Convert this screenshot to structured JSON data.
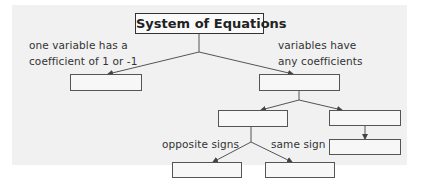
{
  "diagram": {
    "title": "System of Equations",
    "branches": {
      "left_label_line1": "one variable has a",
      "left_label_line2": "coefficient of 1 or -1",
      "right_label_line1": "variables have",
      "right_label_line2": "any coefficients",
      "sub_left_label": "opposite signs",
      "sub_right_label": "same sign"
    },
    "boxes": [
      {
        "id": "left-answer",
        "text": ""
      },
      {
        "id": "right-answer",
        "text": ""
      },
      {
        "id": "mid-left-answer",
        "text": ""
      },
      {
        "id": "mid-right-answer",
        "text": ""
      },
      {
        "id": "bottom-right-answer",
        "text": ""
      },
      {
        "id": "bottom-left-answer",
        "text": ""
      },
      {
        "id": "bottom-mid-answer",
        "text": ""
      }
    ],
    "colors": {
      "background": "#f1f1f1",
      "line": "#444444",
      "text": "#333333"
    }
  }
}
